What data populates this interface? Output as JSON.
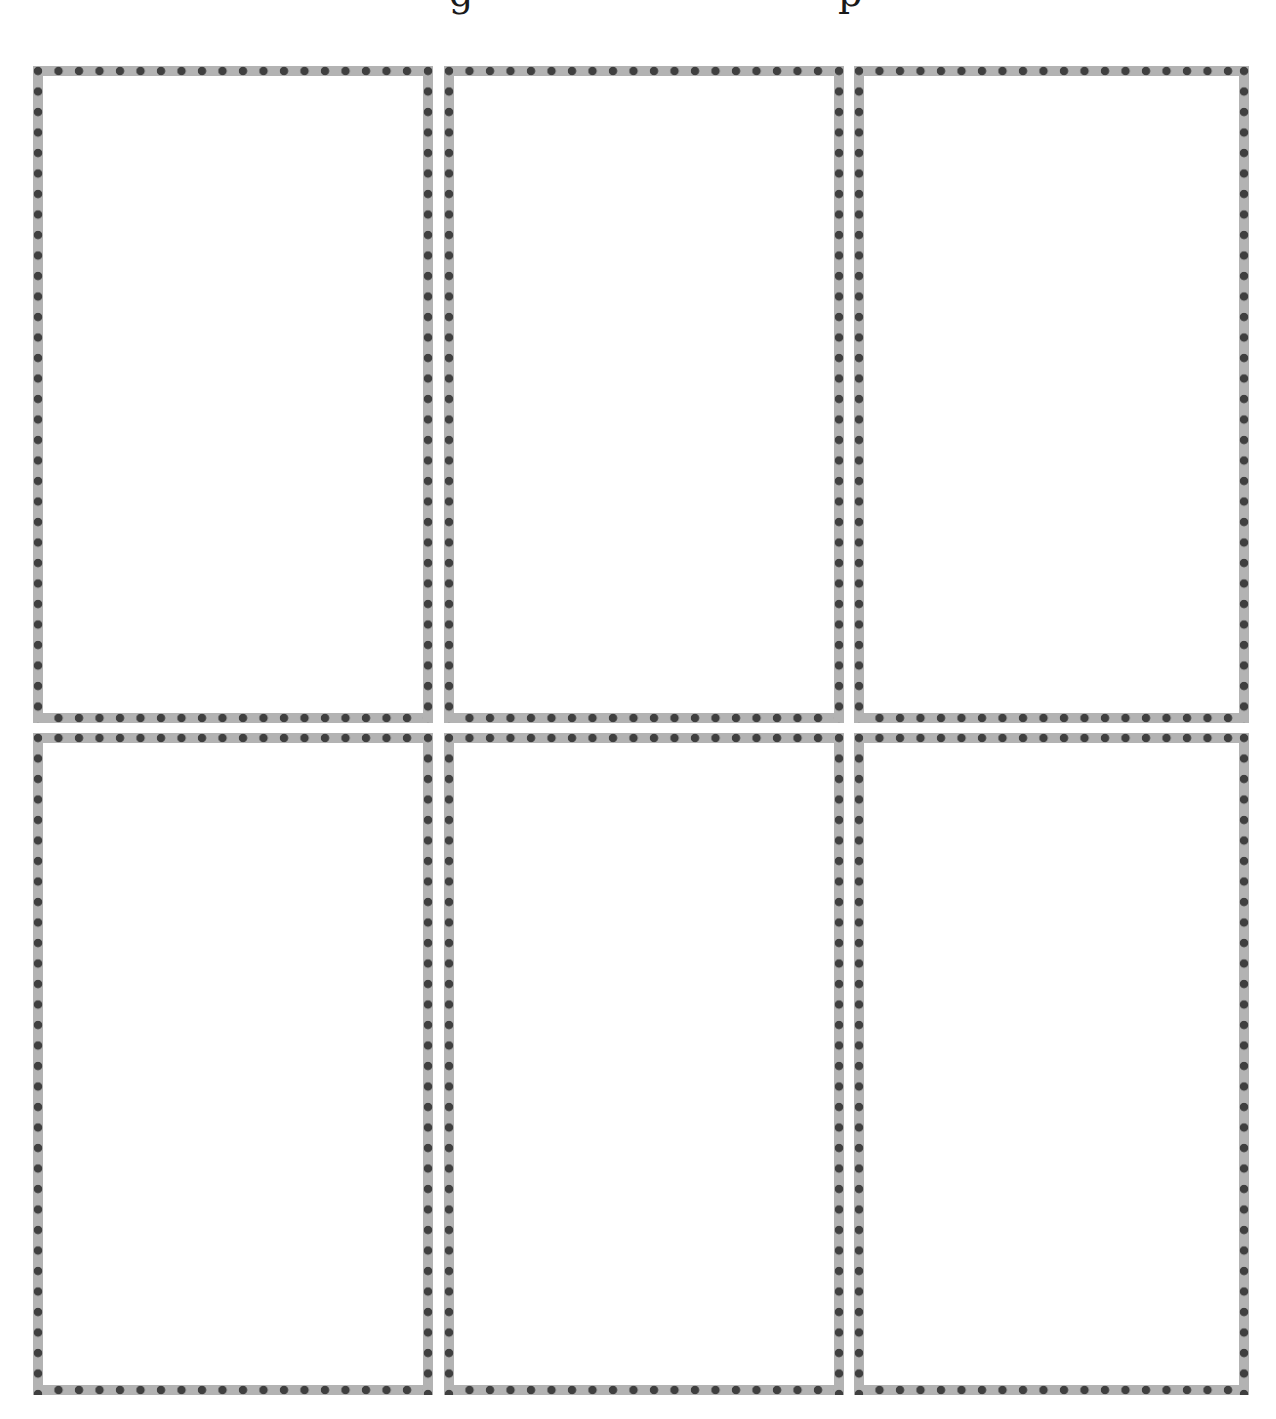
{
  "page": {
    "heading": "…g……………………………………………………p…",
    "heading_visible": "cropped (only descenders of 'g' and 'p' visible at top edge)"
  },
  "layout": {
    "rows": 2,
    "columns": 3,
    "panel_count": 6
  },
  "panels": [
    {
      "id": "panel-1",
      "row": 1,
      "column": 1,
      "content": ""
    },
    {
      "id": "panel-2",
      "row": 1,
      "column": 2,
      "content": ""
    },
    {
      "id": "panel-3",
      "row": 1,
      "column": 3,
      "content": ""
    },
    {
      "id": "panel-4",
      "row": 2,
      "column": 1,
      "content": ""
    },
    {
      "id": "panel-5",
      "row": 2,
      "column": 2,
      "content": ""
    },
    {
      "id": "panel-6",
      "row": 2,
      "column": 3,
      "content": ""
    }
  ],
  "border_style": {
    "type": "dotted-band",
    "band_color": "#b3b3b3",
    "dot_color": "#3f3f3f",
    "band_width_px": 10,
    "dot_spacing_px": 20.5
  }
}
